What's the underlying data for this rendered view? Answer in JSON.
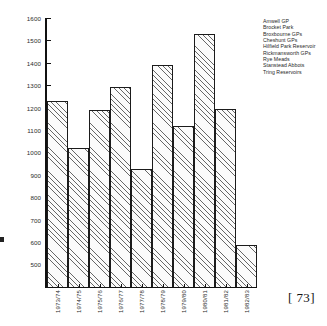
{
  "page": {
    "page_number": "[ 73]"
  },
  "legend": {
    "items": [
      "Amwell GP",
      "Brocket Park",
      "Broxbourne GPs",
      "Cheshunt GPs",
      "Hilfield Park Reservoir",
      "Rickmansworth GPs",
      "Rye Meads",
      "Stanstead Abbots",
      "Tring Reservoirs"
    ]
  },
  "chart_data": {
    "type": "bar",
    "title": "",
    "xlabel": "",
    "ylabel": "",
    "ylim": [
      395,
      1600
    ],
    "yticks": [
      500,
      600,
      700,
      800,
      900,
      1000,
      1100,
      1200,
      1300,
      1400,
      1500,
      1600
    ],
    "ytick_labels": [
      "500",
      "600",
      "700",
      "800",
      "900",
      "1000",
      "1100",
      "1200",
      "1300",
      "1400",
      "1500",
      "1600"
    ],
    "grid": false,
    "legend_position": "right",
    "categories": [
      "1973/74",
      "1974/75",
      "1975/76",
      "1976/77",
      "1977/78",
      "1978/79",
      "1979/80",
      "1980/81",
      "1981/82",
      "1982/83"
    ],
    "values": [
      1223,
      1013,
      1183,
      1288,
      920,
      1385,
      1112,
      1522,
      1188,
      580
    ],
    "series": [
      {
        "name": "Annual total",
        "values": [
          1223,
          1013,
          1183,
          1288,
          920,
          1385,
          1112,
          1522,
          1188,
          580
        ]
      }
    ],
    "bar_style": {
      "fill": "hatched-45deg",
      "edge_color": "#1b1b1b",
      "face_color": "#fbfbfb"
    }
  }
}
